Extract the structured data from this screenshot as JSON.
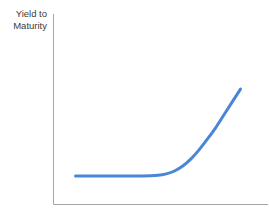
{
  "chart_data": {
    "type": "line",
    "title": "The Yield Curve",
    "title_clipped": true,
    "ylabel_lines": [
      "Yield to",
      "Maturity"
    ],
    "ylabel": "Yield to Maturity",
    "xlabel": "",
    "grid": false,
    "legend": "none",
    "axis_color": "#a6a6a6",
    "series": [
      {
        "name": "Yield Curve",
        "color": "#4a86d8",
        "line_width": 3,
        "x": [
          0,
          10,
          20,
          30,
          40,
          50,
          55,
          60,
          65,
          70,
          75,
          80,
          85,
          90,
          95,
          100
        ],
        "y": [
          20,
          20,
          20,
          20,
          20,
          20.5,
          21.5,
          23.5,
          27,
          32,
          38.5,
          46,
          54,
          63,
          72,
          81
        ]
      }
    ],
    "xlim": [
      0,
      100
    ],
    "ylim": [
      0,
      100
    ],
    "annotations": []
  }
}
